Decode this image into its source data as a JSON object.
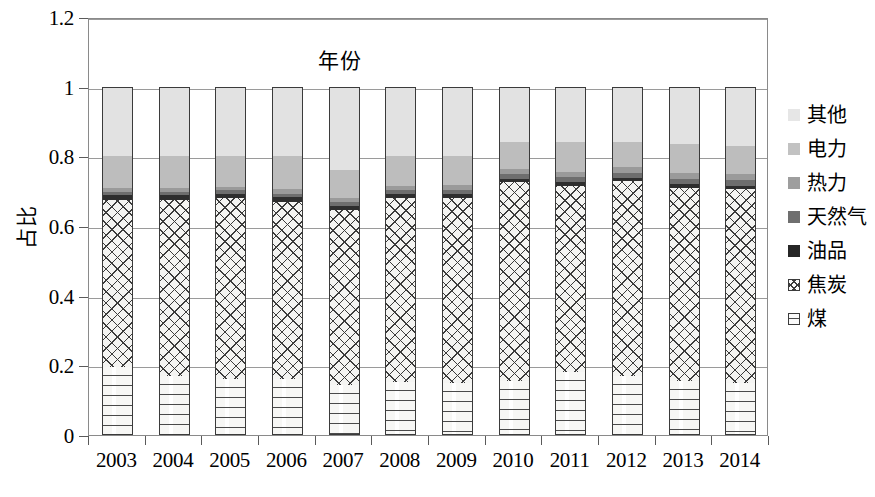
{
  "chart_data": {
    "type": "bar",
    "subtype": "stacked-bar-100",
    "title": "",
    "xlabel": "年份",
    "ylabel": "占比",
    "ylim": [
      0,
      1.2
    ],
    "yticks": [
      0,
      0.2,
      0.4,
      0.6,
      0.8,
      1,
      1.2
    ],
    "ytick_labels": [
      "0",
      "0.2",
      "0.4",
      "0.6",
      "0.8",
      "1",
      "1.2"
    ],
    "grid": true,
    "legend_position": "right",
    "categories": [
      "2003",
      "2004",
      "2005",
      "2006",
      "2007",
      "2008",
      "2009",
      "2010",
      "2011",
      "2012",
      "2013",
      "2014"
    ],
    "series": [
      {
        "name": "煤",
        "key": "coal",
        "fill": "dotted-dash",
        "color": "#f7f7f5",
        "values": [
          0.195,
          0.17,
          0.16,
          0.16,
          0.143,
          0.152,
          0.148,
          0.155,
          0.18,
          0.17,
          0.155,
          0.15
        ]
      },
      {
        "name": "焦炭",
        "key": "coke",
        "fill": "crosshatch",
        "color": "#f4f4f2",
        "values": [
          0.48,
          0.505,
          0.52,
          0.51,
          0.502,
          0.528,
          0.532,
          0.57,
          0.535,
          0.558,
          0.555,
          0.555
        ]
      },
      {
        "name": "油品",
        "key": "oil",
        "fill": "solid",
        "color": "#2e2e2e",
        "values": [
          0.015,
          0.014,
          0.013,
          0.013,
          0.013,
          0.012,
          0.012,
          0.011,
          0.011,
          0.01,
          0.01,
          0.01
        ]
      },
      {
        "name": "天然气",
        "key": "gas",
        "fill": "solid",
        "color": "#6e6e6e",
        "values": [
          0.008,
          0.008,
          0.009,
          0.01,
          0.01,
          0.011,
          0.012,
          0.013,
          0.014,
          0.015,
          0.016,
          0.018
        ]
      },
      {
        "name": "热力",
        "key": "heat",
        "fill": "solid",
        "color": "#9a9a9a",
        "values": [
          0.01,
          0.011,
          0.011,
          0.012,
          0.012,
          0.013,
          0.013,
          0.014,
          0.014,
          0.015,
          0.015,
          0.016
        ]
      },
      {
        "name": "电力",
        "key": "power",
        "fill": "solid",
        "color": "#bdbdbd",
        "values": [
          0.092,
          0.092,
          0.087,
          0.095,
          0.08,
          0.084,
          0.083,
          0.077,
          0.086,
          0.072,
          0.084,
          0.081
        ]
      },
      {
        "name": "其他",
        "key": "other",
        "fill": "solid",
        "color": "#e2e2e2",
        "values": [
          0.2,
          0.2,
          0.2,
          0.2,
          0.24,
          0.2,
          0.2,
          0.16,
          0.16,
          0.16,
          0.165,
          0.17
        ]
      }
    ],
    "legend_entries": [
      {
        "label": "其他",
        "key": "other"
      },
      {
        "label": "电力",
        "key": "power"
      },
      {
        "label": "热力",
        "key": "heat"
      },
      {
        "label": "天然气",
        "key": "gas"
      },
      {
        "label": "油品",
        "key": "oil"
      },
      {
        "label": "焦炭",
        "key": "coke"
      },
      {
        "label": "煤",
        "key": "coal"
      }
    ]
  }
}
